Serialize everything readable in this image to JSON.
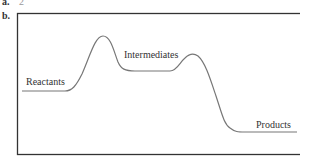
{
  "part_a": {
    "label": "a.",
    "answer": "2"
  },
  "part_b": {
    "label": "b.",
    "diagram": {
      "type": "reaction energy profile",
      "labels": {
        "reactants": "Reactants",
        "intermediates": "Intermediates",
        "products": "Products"
      },
      "line_color": "#777777",
      "frame_color": "#333333"
    }
  }
}
